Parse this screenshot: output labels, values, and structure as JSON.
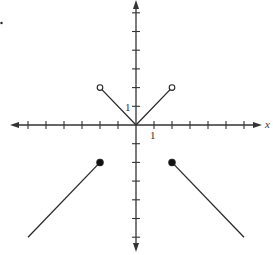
{
  "chart_data": {
    "type": "line",
    "title": "",
    "xlabel": "x",
    "ylabel": "",
    "xlim": [
      -7,
      7
    ],
    "ylim": [
      -7,
      7
    ],
    "grid": false,
    "tick_labels": {
      "x_unit": "1",
      "y_unit": "1"
    },
    "x_ticks": [
      -6,
      -5,
      -4,
      -3,
      -2,
      -1,
      1,
      2,
      3,
      4,
      5,
      6
    ],
    "y_ticks": [
      -6,
      -5,
      -4,
      -3,
      -2,
      -1,
      1,
      2,
      3,
      4,
      5,
      6
    ],
    "series": [
      {
        "name": "left ray",
        "points": [
          [
            -6,
            -6
          ],
          [
            -2,
            -2
          ]
        ],
        "endpoints": [
          {
            "x": -2,
            "y": -2,
            "closed": true
          }
        ]
      },
      {
        "name": "middle V",
        "points": [
          [
            -2,
            2
          ],
          [
            0,
            0
          ],
          [
            2,
            2
          ]
        ],
        "endpoints": [
          {
            "x": -2,
            "y": 2,
            "closed": false
          },
          {
            "x": 2,
            "y": 2,
            "closed": false
          }
        ]
      },
      {
        "name": "right ray",
        "points": [
          [
            2,
            -2
          ],
          [
            6,
            -6
          ]
        ],
        "endpoints": [
          {
            "x": 2,
            "y": -2,
            "closed": true
          }
        ]
      }
    ]
  },
  "labels": {
    "x_axis": "x",
    "x_unit": "1",
    "y_unit": "1"
  }
}
